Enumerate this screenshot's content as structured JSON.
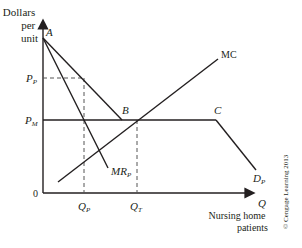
{
  "diagram": {
    "y_axis_label": [
      "Dollars",
      "per",
      "unit"
    ],
    "x_axis_symbol": "Q",
    "x_axis_label": [
      "Nursing home",
      "patients"
    ],
    "origin": "0",
    "points": {
      "A": "A",
      "B": "B",
      "C": "C"
    },
    "price_labels": {
      "pp_main": "P",
      "pp_sub": "P",
      "pm_main": "P",
      "pm_sub": "M"
    },
    "quantity_labels": {
      "qp_main": "Q",
      "qp_sub": "P",
      "qt_main": "Q",
      "qt_sub": "T"
    },
    "curves": {
      "mc": "MC",
      "mr_main": "MR",
      "mr_sub": "P",
      "d_main": "D",
      "d_sub": "P"
    },
    "copyright": "© Cengage Learning 2013",
    "colors": {
      "line": "#231f20",
      "dashed": "#555555"
    }
  }
}
